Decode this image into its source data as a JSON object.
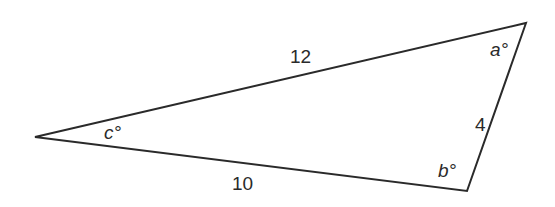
{
  "diagram": {
    "type": "triangle",
    "stroke_color": "#2a2a2a",
    "vertices": {
      "C": [
        35,
        137
      ],
      "A": [
        526,
        23
      ],
      "B": [
        467,
        191
      ]
    },
    "sides": [
      {
        "between": [
          "C",
          "A"
        ],
        "label": "12"
      },
      {
        "between": [
          "A",
          "B"
        ],
        "label": "4"
      },
      {
        "between": [
          "C",
          "B"
        ],
        "label": "10"
      }
    ],
    "angles": [
      {
        "vertex": "A",
        "label": "a°"
      },
      {
        "vertex": "B",
        "label": "b°"
      },
      {
        "vertex": "C",
        "label": "c°"
      }
    ]
  },
  "labels": {
    "side_top": "12",
    "side_right": "4",
    "side_bottom": "10",
    "angle_a": "a°",
    "angle_b": "b°",
    "angle_c": "c°"
  }
}
